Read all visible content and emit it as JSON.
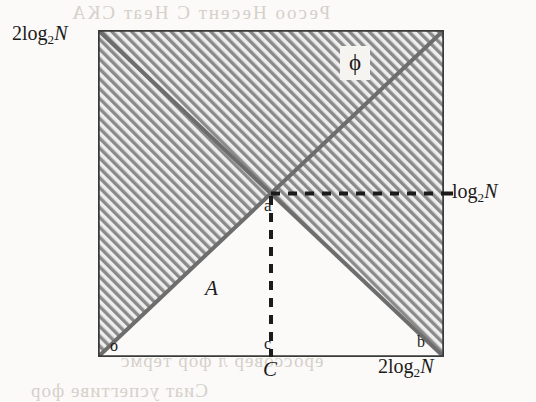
{
  "figure": {
    "type": "geometric-diagram",
    "square": {
      "x": 0,
      "y": 0,
      "width": 346,
      "height": 327,
      "border_color": "#3a3a3a",
      "hatch_color": "#8e8e8e",
      "fill_color": "#e8e8e8"
    },
    "labels": {
      "axis_top_left_prefix": "2log",
      "axis_top_left_sub": "2",
      "axis_top_left_var": "N",
      "axis_right_prefix": "log",
      "axis_right_sub": "2",
      "axis_right_var": "N",
      "axis_bottom_right_prefix": "2log",
      "axis_bottom_right_sub": "2",
      "axis_bottom_right_var": "N",
      "region_phi": "ϕ",
      "region_A": "A",
      "point_o": "o",
      "point_a": "a",
      "point_b": "b",
      "point_c": "c",
      "segment_C": "C"
    },
    "lines": {
      "diagonal_1": "o to top-right corner",
      "diagonal_2": "top-left corner to b",
      "dashed_vertical": "a to c",
      "dashed_horizontal": "a to right axis label log2N"
    }
  },
  "bleedthrough": {
    "line_top": "Ресоо Несент С Неат СКА",
    "line_1": "тнат сомпаре толеча фор",
    "line_2": "ергастуре то еравере",
    "line_3": "ероссовер л фор термс",
    "line_4": "Сиат успегтиве фор"
  }
}
